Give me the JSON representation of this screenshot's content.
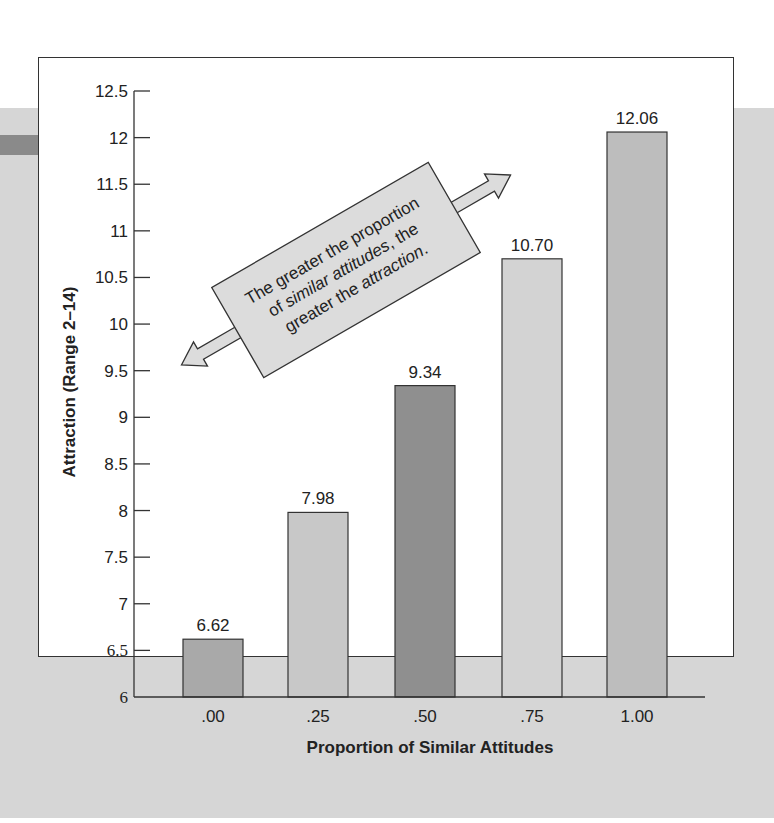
{
  "chart_data": {
    "type": "bar",
    "title": "",
    "xlabel": "Proportion of Similar Attitudes",
    "ylabel": "Attraction (Range 2–14)",
    "categories": [
      ".00",
      ".25",
      ".50",
      ".75",
      "1.00"
    ],
    "values": [
      6.62,
      7.98,
      9.34,
      10.7,
      12.06
    ],
    "value_labels": [
      "6.62",
      "7.98",
      "9.34",
      "10.70",
      "12.06"
    ],
    "ylim": [
      6,
      12.5
    ],
    "yticks": [
      "6",
      "6.5",
      "7",
      "7.5",
      "8",
      "8.5",
      "9",
      "9.5",
      "10",
      "10.5",
      "11",
      "11.5",
      "12",
      "12.5"
    ],
    "grid": false,
    "legend": null,
    "bar_colors": [
      "#a9a9a9",
      "#c8c8c8",
      "#8f8f8f",
      "#d3d3d3",
      "#bdbdbd"
    ],
    "annotation": {
      "line1": "The greater the proportion",
      "line2_pre": "of ",
      "line2_italic": "similar attitudes",
      "line2_post": ", the",
      "line3_pre": "greater the ",
      "line3_italic": "attraction",
      "line3_post": "."
    }
  }
}
